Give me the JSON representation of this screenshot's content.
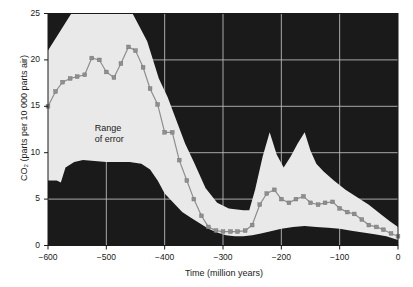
{
  "chart_data": {
    "type": "line",
    "title": "",
    "xlabel": "Time (million years)",
    "ylabel": "CO₂ (parts per 10 000 parts air)",
    "xlim": [
      -600,
      0
    ],
    "ylim": [
      0,
      25
    ],
    "xticks": [
      -600,
      -500,
      -400,
      -300,
      -200,
      -100,
      0
    ],
    "xticklabels": [
      "−600",
      "−500",
      "−400",
      "−300",
      "−200",
      "−100",
      "0"
    ],
    "yticks": [
      0,
      5,
      10,
      15,
      20,
      25
    ],
    "yticklabels": [
      "0",
      "5",
      "10",
      "15",
      "20",
      "25"
    ],
    "grid": true,
    "legend_position": "none",
    "plot_background": "#1a1a1a",
    "grid_color": "#b9b9b9",
    "band_color": "#e9e9e9",
    "line_color": "#8e8e8e",
    "marker_color": "#8e8e8e",
    "annotations": [
      {
        "text_line1": "Range",
        "text_line2": "of error",
        "x": -520,
        "y": 12.6
      }
    ],
    "series": [
      {
        "name": "CO2 best estimate",
        "x": [
          -600,
          -587,
          -575,
          -562,
          -550,
          -537,
          -525,
          -512,
          -500,
          -487,
          -475,
          -462,
          -450,
          -437,
          -425,
          -412,
          -400,
          -387,
          -375,
          -362,
          -350,
          -337,
          -325,
          -312,
          -300,
          -287,
          -275,
          -262,
          -250,
          -237,
          -225,
          -212,
          -200,
          -187,
          -175,
          -162,
          -150,
          -137,
          -125,
          -112,
          -100,
          -87,
          -75,
          -62,
          -50,
          -37,
          -25,
          -12,
          0
        ],
        "values": [
          15.0,
          16.6,
          17.6,
          18.0,
          18.2,
          18.4,
          20.2,
          20.0,
          18.7,
          18.1,
          19.6,
          21.4,
          21.0,
          19.2,
          16.9,
          15.2,
          12.2,
          12.2,
          9.2,
          7.0,
          5.0,
          3.2,
          2.0,
          1.6,
          1.5,
          1.5,
          1.5,
          1.6,
          2.2,
          4.4,
          5.6,
          6.0,
          5.0,
          4.6,
          5.0,
          5.3,
          4.6,
          4.4,
          4.6,
          4.7,
          4.0,
          3.6,
          3.4,
          2.8,
          2.2,
          2.0,
          1.7,
          1.3,
          1.0
        ]
      },
      {
        "name": "Range of error upper bound",
        "x": [
          -600,
          -580,
          -560,
          -520,
          -480,
          -455,
          -430,
          -410,
          -395,
          -380,
          -365,
          -350,
          -330,
          -310,
          -290,
          -265,
          -255,
          -245,
          -232,
          -220,
          -208,
          -196,
          -184,
          -172,
          -160,
          -150,
          -140,
          -128,
          -110,
          -90,
          -70,
          -50,
          -30,
          -14,
          0
        ],
        "values": [
          21.0,
          23.0,
          25.0,
          25.0,
          25.0,
          25.0,
          22.0,
          18.0,
          16.0,
          13.5,
          11.0,
          9.0,
          6.2,
          4.6,
          4.0,
          3.8,
          3.8,
          6.0,
          9.6,
          12.2,
          9.8,
          8.4,
          9.6,
          11.0,
          12.2,
          10.2,
          8.8,
          8.0,
          7.0,
          6.0,
          5.2,
          4.4,
          3.4,
          2.6,
          2.0
        ]
      },
      {
        "name": "Range of error lower bound",
        "x": [
          -600,
          -585,
          -578,
          -570,
          -555,
          -540,
          -520,
          -500,
          -480,
          -460,
          -440,
          -425,
          -412,
          -400,
          -385,
          -370,
          -355,
          -340,
          -325,
          -310,
          -295,
          -280,
          -265,
          -250,
          -235,
          -220,
          -200,
          -180,
          -160,
          -140,
          -120,
          -100,
          -80,
          -60,
          -40,
          -20,
          0
        ],
        "values": [
          7.0,
          7.0,
          6.8,
          8.4,
          9.0,
          9.2,
          9.1,
          9.0,
          9.0,
          9.0,
          8.8,
          8.2,
          7.0,
          5.6,
          4.6,
          3.6,
          3.0,
          2.4,
          1.8,
          1.4,
          1.1,
          1.0,
          1.0,
          1.1,
          1.3,
          1.5,
          1.8,
          2.0,
          2.1,
          2.0,
          1.9,
          1.8,
          1.6,
          1.4,
          1.2,
          1.0,
          0.6
        ]
      }
    ]
  }
}
